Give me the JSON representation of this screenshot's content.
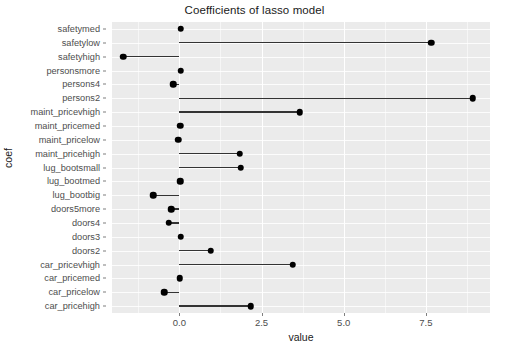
{
  "chart_data": {
    "type": "bar",
    "title": "Coefficients of lasso model",
    "xlabel": "value",
    "ylabel": "coef",
    "xlim": [
      -2.05,
      9.45
    ],
    "xticks": [
      0.0,
      2.5,
      5.0,
      7.5
    ],
    "xtick_labels": [
      "0.0",
      "2.5",
      "5.0",
      "7.5"
    ],
    "grid": true,
    "legend": "none",
    "orientation": "horizontal",
    "baseline": 0.0,
    "categories": [
      "safetymed",
      "safetylow",
      "safetyhigh",
      "personsmore",
      "persons4",
      "persons2",
      "maint_pricevhigh",
      "maint_pricemed",
      "maint_pricelow",
      "maint_pricehigh",
      "lug_bootsmall",
      "lug_bootmed",
      "lug_bootbig",
      "doors5more",
      "doors4",
      "doors3",
      "doors2",
      "car_pricevhigh",
      "car_pricemed",
      "car_pricelow",
      "car_pricehigh"
    ],
    "values": [
      0.04,
      7.66,
      -1.71,
      0.04,
      -0.18,
      8.93,
      3.66,
      0.02,
      -0.03,
      1.83,
      1.86,
      0.03,
      -0.79,
      -0.25,
      -0.33,
      0.04,
      0.95,
      3.45,
      0.01,
      -0.46,
      2.17
    ]
  },
  "style": {
    "panel_background": "#ebebeb",
    "grid_color": "#ffffff",
    "point_color": "#000000",
    "segment_color": "#333333",
    "text_color": "#4d4d4d",
    "title_color": "#1a1a1a"
  }
}
